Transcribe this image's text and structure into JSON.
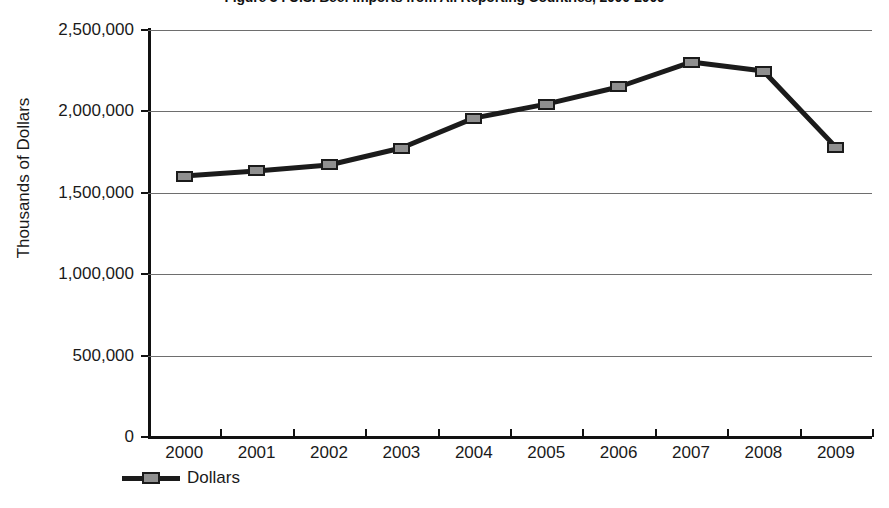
{
  "chart_data": {
    "type": "line",
    "title": "Figure 3 : U.S. Beef Imports from All Reporting Countries, 2000-2009",
    "title_clipped": true,
    "xlabel": "",
    "ylabel": "Thousands of Dollars",
    "categories": [
      "2000",
      "2001",
      "2002",
      "2003",
      "2004",
      "2005",
      "2006",
      "2007",
      "2008",
      "2009"
    ],
    "series": [
      {
        "name": "Dollars",
        "values": [
          1603000,
          1634000,
          1671000,
          1775000,
          1959000,
          2045000,
          2150000,
          2303000,
          2248000,
          1781000
        ],
        "line_color": "#1b1b1b",
        "marker_fill": "#8f8f8f",
        "marker_edge": "#1b1b1b"
      }
    ],
    "ylim": [
      0,
      2500000
    ],
    "ytick_values": [
      0,
      500000,
      1000000,
      1500000,
      2000000,
      2500000
    ],
    "ytick_labels": [
      "0",
      "500,000",
      "1,000,000",
      "1,500,000",
      "2,000,000",
      "2,500,000"
    ],
    "grid": true,
    "grid_axis": "y",
    "grid_color": "#6e6e6e",
    "legend_position": "bottom-left",
    "legend_entries": [
      "Dollars"
    ]
  },
  "legend": {
    "label": "Dollars"
  },
  "axes": {
    "y_title": "Thousands of Dollars"
  }
}
